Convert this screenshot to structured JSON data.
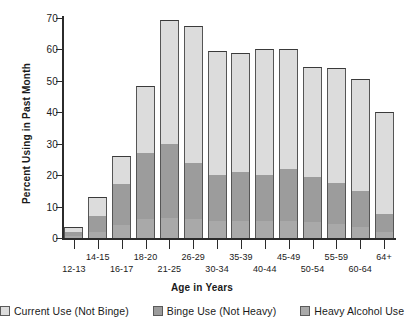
{
  "chart_data": {
    "type": "bar",
    "subtype": "stacked-bar",
    "title": "",
    "xlabel": "Age in Years",
    "ylabel": "Percent Using in Past Month",
    "ylim": [
      0,
      70
    ],
    "yticks": [
      0,
      10,
      20,
      30,
      40,
      50,
      60,
      70
    ],
    "grid": false,
    "legend_position": "bottom",
    "categories": [
      "12-13",
      "14-15",
      "16-17",
      "18-20",
      "21-25",
      "26-29",
      "30-34",
      "35-39",
      "40-44",
      "45-49",
      "50-54",
      "55-59",
      "60-64",
      "64+"
    ],
    "series": [
      {
        "name": "Heavy Alcohol Use",
        "color": "#a9a9a9",
        "values": [
          0.8,
          1.8,
          4.0,
          6.0,
          6.5,
          6.0,
          5.5,
          5.5,
          5.5,
          5.5,
          5.0,
          4.5,
          3.5,
          2.0
        ]
      },
      {
        "name": "Binge Use (Not Heavy)",
        "color": "#9c9c9c",
        "values": [
          1.2,
          5.2,
          13.3,
          21.0,
          23.5,
          18.0,
          14.5,
          15.5,
          14.5,
          16.5,
          14.5,
          13.0,
          11.5,
          5.5
        ]
      },
      {
        "name": "Current Use (Not Binge)",
        "color": "#dcdcdc",
        "values": [
          1.5,
          6.0,
          8.7,
          21.5,
          39.5,
          43.5,
          39.5,
          38.0,
          40.0,
          38.0,
          35.0,
          36.5,
          35.5,
          32.5
        ]
      }
    ],
    "totals": [
      3.5,
      13.0,
      26.0,
      48.5,
      69.5,
      67.5,
      59.5,
      59.0,
      60.0,
      60.0,
      54.5,
      54.0,
      50.5,
      40.0
    ]
  },
  "axis": {
    "y_title": "Percent Using in Past Month",
    "x_title": "Age in Years",
    "y_ticks": [
      "0",
      "10",
      "20",
      "30",
      "40",
      "50",
      "60",
      "70"
    ]
  },
  "legend": {
    "items": [
      {
        "label": "Current Use (Not Binge)",
        "color": "#dcdcdc",
        "swatch_name": "legend-swatch-current-use"
      },
      {
        "label": "Binge Use (Not Heavy)",
        "color": "#9c9c9c",
        "swatch_name": "legend-swatch-binge-use"
      },
      {
        "label": "Heavy Alcohol Use",
        "color": "#a9a9a9",
        "swatch_name": "legend-swatch-heavy-use"
      }
    ]
  }
}
